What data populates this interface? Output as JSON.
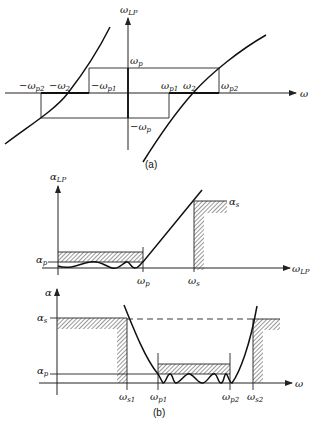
{
  "figure": {
    "panel_a": {
      "caption": "(a)",
      "y_axis_label": {
        "main": "ω",
        "sub": "LP"
      },
      "x_axis_label": "ω",
      "labels": {
        "wp": {
          "main": "ω",
          "sub": "p"
        },
        "neg_wp": {
          "main": "−ω",
          "sub": "p"
        },
        "wp1": {
          "main": "ω",
          "sub": "p1"
        },
        "w2": {
          "main": "ω",
          "sub": "2"
        },
        "wp2": {
          "main": "ω",
          "sub": "p2"
        },
        "neg_wp2": {
          "main": "−ω",
          "sub": "p2"
        },
        "neg_w2": {
          "main": "−ω",
          "sub": "2"
        },
        "neg_wp1": {
          "main": "−ω",
          "sub": "p1"
        }
      }
    },
    "panel_b_top": {
      "y_axis_label": {
        "main": "α",
        "sub": "LP"
      },
      "x_axis_label": {
        "main": "ω",
        "sub": "LP"
      },
      "labels": {
        "alpha_p": {
          "main": "α",
          "sub": "p"
        },
        "alpha_s": {
          "main": "α",
          "sub": "s"
        },
        "wp": {
          "main": "ω",
          "sub": "p"
        },
        "ws": {
          "main": "ω",
          "sub": "s"
        }
      }
    },
    "panel_b_bottom": {
      "caption": "(b)",
      "y_axis_label": "α",
      "x_axis_label": "ω",
      "labels": {
        "alpha_s": {
          "main": "α",
          "sub": "s"
        },
        "alpha_p": {
          "main": "α",
          "sub": "p"
        },
        "ws1": {
          "main": "ω",
          "sub": "s1"
        },
        "wp1": {
          "main": "ω",
          "sub": "p1"
        },
        "wp2": {
          "main": "ω",
          "sub": "p2"
        },
        "ws2": {
          "main": "ω",
          "sub": "s2"
        }
      }
    }
  }
}
